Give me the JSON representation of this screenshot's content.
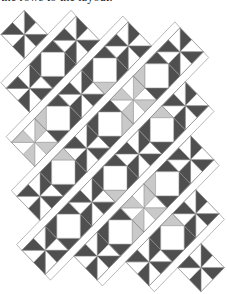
{
  "caption": "the rows to the layout.",
  "colors": {
    "dark": "#4f4f4f",
    "light": "#c9c9c9",
    "white": "#ffffff",
    "line": "#8a8a8a"
  },
  "quilt": {
    "block_types": [
      "pinwheel",
      "square"
    ],
    "rows": [
      {
        "start_col": 0,
        "blocks": [
          {
            "type": "pinwheel",
            "tone": "dark"
          }
        ]
      },
      {
        "start_col": -1,
        "blocks": [
          {
            "type": "pinwheel",
            "tone": "dark"
          },
          {
            "type": "square",
            "light_corners": []
          },
          {
            "type": "pinwheel",
            "tone": "dark"
          }
        ]
      },
      {
        "start_col": -2,
        "blocks": [
          {
            "type": "pinwheel",
            "tone": "light"
          },
          {
            "type": "square",
            "light_corners": [
              "W"
            ]
          },
          {
            "type": "pinwheel",
            "tone": "dark"
          },
          {
            "type": "square",
            "light_corners": [
              "S"
            ]
          },
          {
            "type": "pinwheel",
            "tone": "dark"
          }
        ]
      },
      {
        "start_col": -3,
        "blocks": [
          {
            "type": "pinwheel",
            "tone": "dark"
          },
          {
            "type": "square",
            "light_corners": [
              "N"
            ]
          },
          {
            "type": "pinwheel",
            "tone": "dark"
          },
          {
            "type": "square",
            "light_corners": [
              "E"
            ]
          },
          {
            "type": "pinwheel",
            "tone": "light"
          },
          {
            "type": "square",
            "light_corners": [
              "W"
            ]
          },
          {
            "type": "pinwheel",
            "tone": "dark"
          }
        ]
      },
      {
        "start_col": -4,
        "blocks": [
          {
            "type": "pinwheel",
            "tone": "dark"
          },
          {
            "type": "square",
            "light_corners": []
          },
          {
            "type": "pinwheel",
            "tone": "dark"
          },
          {
            "type": "square",
            "light_corners": [
              "S"
            ]
          },
          {
            "type": "pinwheel",
            "tone": "dark"
          },
          {
            "type": "square",
            "light_corners": [
              "N"
            ]
          },
          {
            "type": "pinwheel",
            "tone": "dark"
          }
        ]
      },
      {
        "start_col": -3,
        "blocks": [
          {
            "type": "pinwheel",
            "tone": "dark"
          },
          {
            "type": "square",
            "light_corners": [
              "E"
            ]
          },
          {
            "type": "pinwheel",
            "tone": "light"
          },
          {
            "type": "square",
            "light_corners": [
              "W"
            ]
          },
          {
            "type": "pinwheel",
            "tone": "dark"
          }
        ]
      },
      {
        "start_col": -2,
        "blocks": [
          {
            "type": "pinwheel",
            "tone": "dark"
          },
          {
            "type": "square",
            "light_corners": [
              "N"
            ]
          },
          {
            "type": "pinwheel",
            "tone": "dark"
          }
        ]
      },
      {
        "start_col": -1,
        "blocks": [
          {
            "type": "pinwheel",
            "tone": "dark"
          }
        ]
      }
    ]
  }
}
